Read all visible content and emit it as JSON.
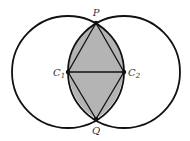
{
  "diagram": {
    "colors": {
      "stroke": "#111111",
      "fill": "#b4b4b4",
      "label": "#333333",
      "background": "#ffffff"
    },
    "points": {
      "P": {
        "label": "P",
        "x": 96,
        "y": 23
      },
      "Q": {
        "label": "Q",
        "x": 96,
        "y": 119
      },
      "C1": {
        "label": "C",
        "subscript": "1",
        "x": 68,
        "y": 72
      },
      "C2": {
        "label": "C",
        "subscript": "2",
        "x": 124,
        "y": 72
      }
    },
    "circles": [
      {
        "center": "C1",
        "radius": 56
      },
      {
        "center": "C2",
        "radius": 56
      }
    ],
    "segments": [
      [
        "C1",
        "C2"
      ],
      [
        "P",
        "C1"
      ],
      [
        "P",
        "C2"
      ],
      [
        "Q",
        "C1"
      ],
      [
        "Q",
        "C2"
      ]
    ],
    "shaded_region": "lens intersection of both circles"
  }
}
